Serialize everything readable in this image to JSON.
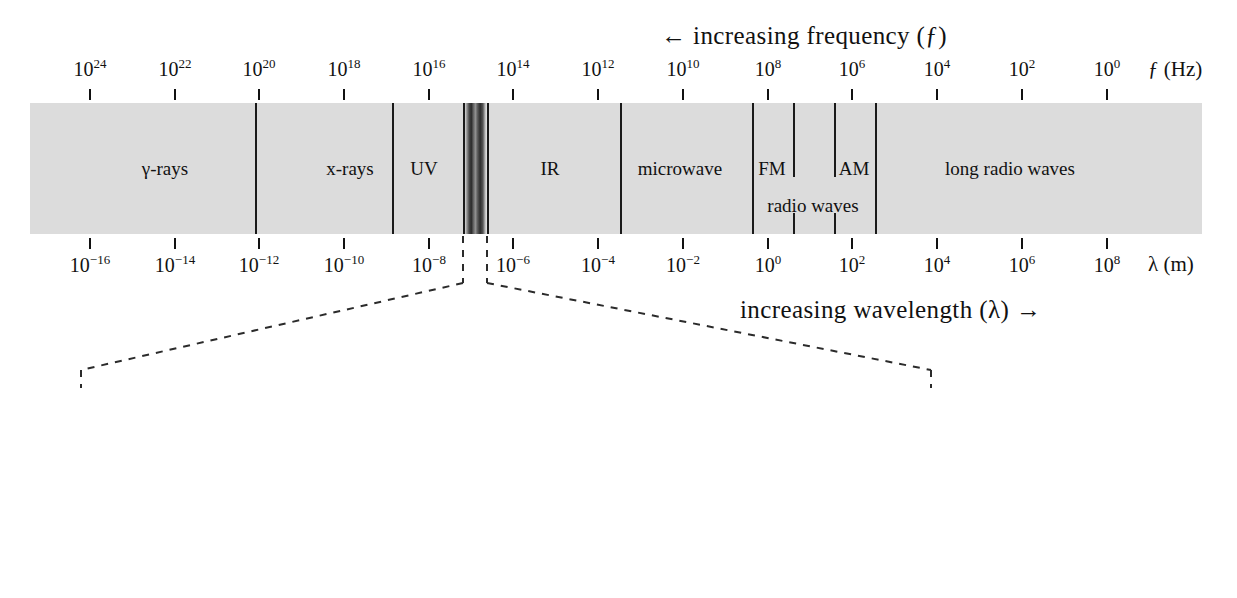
{
  "figure": {
    "frequency_arrow_label": "←  increasing  frequency (ƒ)",
    "wavelength_arrow_label": "increasing  wavelength (λ) →",
    "visible_title": "visible spectrum",
    "frequency_axis_name": "ƒ (Hz)",
    "wavelength_axis_name": "λ (m)",
    "bar_color": "#dcdcdc",
    "line_color": "#1a1a1a"
  },
  "frequency_axis": {
    "unit": "Hz",
    "ticks": [
      {
        "label": "10",
        "exp": "24",
        "x": 90
      },
      {
        "label": "10",
        "exp": "22",
        "x": 175
      },
      {
        "label": "10",
        "exp": "20",
        "x": 259
      },
      {
        "label": "10",
        "exp": "18",
        "x": 344
      },
      {
        "label": "10",
        "exp": "16",
        "x": 429
      },
      {
        "label": "10",
        "exp": "14",
        "x": 513
      },
      {
        "label": "10",
        "exp": "12",
        "x": 598
      },
      {
        "label": "10",
        "exp": "10",
        "x": 683
      },
      {
        "label": "10",
        "exp": "8",
        "x": 768
      },
      {
        "label": "10",
        "exp": "6",
        "x": 852
      },
      {
        "label": "10",
        "exp": "4",
        "x": 937
      },
      {
        "label": "10",
        "exp": "2",
        "x": 1022
      },
      {
        "label": "10",
        "exp": "0",
        "x": 1107
      }
    ]
  },
  "wavelength_axis": {
    "unit": "m",
    "ticks": [
      {
        "label": "10",
        "exp": "−16",
        "x": 90
      },
      {
        "label": "10",
        "exp": "−14",
        "x": 175
      },
      {
        "label": "10",
        "exp": "−12",
        "x": 259
      },
      {
        "label": "10",
        "exp": "−10",
        "x": 344
      },
      {
        "label": "10",
        "exp": "−8",
        "x": 429
      },
      {
        "label": "10",
        "exp": "−6",
        "x": 513
      },
      {
        "label": "10",
        "exp": "−4",
        "x": 598
      },
      {
        "label": "10",
        "exp": "−2",
        "x": 683
      },
      {
        "label": "10",
        "exp": "0",
        "x": 768
      },
      {
        "label": "10",
        "exp": "2",
        "x": 852
      },
      {
        "label": "10",
        "exp": "4",
        "x": 937
      },
      {
        "label": "10",
        "exp": "6",
        "x": 1022
      },
      {
        "label": "10",
        "exp": "8",
        "x": 1107
      }
    ]
  },
  "bands": [
    {
      "name": "gamma-rays",
      "label": "γ-rays",
      "center_x": 165,
      "row": 1
    },
    {
      "name": "x-rays",
      "label": "x-rays",
      "center_x": 350,
      "row": 1
    },
    {
      "name": "uv",
      "label": "UV",
      "center_x": 424,
      "row": 1
    },
    {
      "name": "ir",
      "label": "IR",
      "center_x": 550,
      "row": 1
    },
    {
      "name": "microwave",
      "label": "microwave",
      "center_x": 680,
      "row": 1
    },
    {
      "name": "fm",
      "label": "FM",
      "center_x": 772,
      "row": 1
    },
    {
      "name": "am",
      "label": "AM",
      "center_x": 854,
      "row": 1
    },
    {
      "name": "long-radio-waves",
      "label": "long radio waves",
      "center_x": 1010,
      "row": 1
    },
    {
      "name": "radio-waves",
      "label": "radio waves",
      "center_x": 813,
      "row": 2
    }
  ],
  "band_dividers": [
    {
      "name": "gamma-xray-divider",
      "x": 255,
      "kind": "full"
    },
    {
      "name": "xray-uv-divider",
      "x": 392,
      "kind": "full"
    },
    {
      "name": "uv-visible-divider",
      "x": 463,
      "kind": "full"
    },
    {
      "name": "visible-ir-divider",
      "x": 487,
      "kind": "full"
    },
    {
      "name": "ir-microwave-divider",
      "x": 620,
      "kind": "full"
    },
    {
      "name": "microwave-radio-divider",
      "x": 752,
      "kind": "full"
    },
    {
      "name": "fm-divider",
      "x": 793,
      "kind": "partial"
    },
    {
      "name": "am-left-divider",
      "x": 834,
      "kind": "partial"
    },
    {
      "name": "radio-long-divider",
      "x": 875,
      "kind": "full"
    }
  ],
  "visible_spectrum": {
    "boundaries": [
      {
        "value": "380",
        "x": 80
      },
      {
        "value": "450",
        "x": 202
      },
      {
        "value": "495",
        "x": 281
      },
      {
        "value": "570",
        "x": 480
      },
      {
        "value": "590",
        "x": 545
      },
      {
        "value": "620",
        "x": 630
      },
      {
        "value": "750",
        "x": 930
      }
    ],
    "letters": [
      {
        "name": "violet",
        "label": "V",
        "x": 141
      },
      {
        "name": "blue",
        "label": "B",
        "x": 242
      },
      {
        "name": "green",
        "label": "G",
        "x": 381
      },
      {
        "name": "yellow",
        "label": "Y",
        "x": 513
      },
      {
        "name": "orange",
        "label": "O",
        "x": 588
      },
      {
        "name": "red",
        "label": "R",
        "x": 780
      }
    ]
  }
}
